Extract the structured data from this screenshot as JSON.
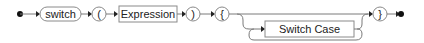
{
  "diagram": {
    "type": "railroad-syntax-diagram",
    "colors": {
      "line": "#7a7a7a",
      "box_border": "#8a8a8a",
      "text": "#222222",
      "marker": "#111111"
    },
    "nodes": [
      {
        "id": "kw_switch",
        "kind": "terminal",
        "label": "switch"
      },
      {
        "id": "lparen",
        "kind": "terminal",
        "label": "("
      },
      {
        "id": "expression",
        "kind": "nonterminal",
        "label": "Expression"
      },
      {
        "id": "rparen",
        "kind": "terminal",
        "label": ")"
      },
      {
        "id": "lbrace",
        "kind": "terminal",
        "label": "{"
      },
      {
        "id": "switch_case",
        "kind": "nonterminal",
        "label": "Switch Case",
        "repeat": "zero-or-more"
      },
      {
        "id": "rbrace",
        "kind": "terminal",
        "label": "}"
      }
    ],
    "start_marker": "start-dot",
    "end_marker": "end-dot"
  }
}
